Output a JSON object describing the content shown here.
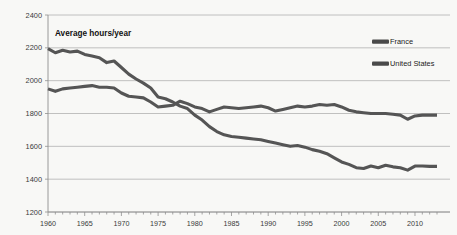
{
  "chart_data": {
    "type": "line",
    "title": "",
    "subtitle": "",
    "annotation": "Average hours/year",
    "xlabel": "",
    "ylabel": "Average hours/year",
    "xlim": [
      1960,
      2013
    ],
    "ylim": [
      1200,
      2400
    ],
    "yticks": [
      1200,
      1400,
      1600,
      1800,
      2000,
      2200,
      2400
    ],
    "ytick_labels": [
      "1200",
      "1400",
      "1600",
      "1800",
      "2000",
      "2200",
      "2400"
    ],
    "xticks": [
      1960,
      1965,
      1970,
      1975,
      1980,
      1985,
      1990,
      1995,
      2000,
      2005,
      2010
    ],
    "xtick_labels": [
      "1960",
      "1965",
      "1970",
      "1975",
      "1980",
      "1985",
      "1990",
      "1995",
      "2000",
      "2005",
      "2010"
    ],
    "x_minor_tick_step": 1,
    "grid": "horizontal",
    "legend_position": "top-right",
    "x": [
      1960,
      1961,
      1962,
      1963,
      1964,
      1965,
      1966,
      1967,
      1968,
      1969,
      1970,
      1971,
      1972,
      1973,
      1974,
      1975,
      1976,
      1977,
      1978,
      1979,
      1980,
      1981,
      1982,
      1983,
      1984,
      1985,
      1986,
      1987,
      1988,
      1989,
      1990,
      1991,
      1992,
      1993,
      1994,
      1995,
      1996,
      1997,
      1998,
      1999,
      2000,
      2001,
      2002,
      2003,
      2004,
      2005,
      2006,
      2007,
      2008,
      2009,
      2010,
      2011,
      2012,
      2013
    ],
    "series": [
      {
        "name": "France",
        "color": "#555555",
        "values": [
          2195,
          2170,
          2185,
          2175,
          2180,
          2160,
          2150,
          2140,
          2110,
          2120,
          2080,
          2040,
          2010,
          1985,
          1955,
          1900,
          1890,
          1870,
          1845,
          1830,
          1790,
          1760,
          1720,
          1690,
          1670,
          1660,
          1655,
          1650,
          1645,
          1640,
          1630,
          1620,
          1610,
          1600,
          1605,
          1595,
          1580,
          1570,
          1555,
          1530,
          1505,
          1490,
          1470,
          1465,
          1480,
          1470,
          1485,
          1475,
          1470,
          1455,
          1480,
          1480,
          1478,
          1478
        ]
      },
      {
        "name": "United States",
        "color": "#555555",
        "values": [
          1950,
          1935,
          1950,
          1955,
          1960,
          1965,
          1970,
          1960,
          1960,
          1955,
          1925,
          1905,
          1900,
          1895,
          1870,
          1840,
          1845,
          1850,
          1875,
          1860,
          1840,
          1830,
          1810,
          1825,
          1840,
          1835,
          1830,
          1835,
          1840,
          1845,
          1835,
          1815,
          1825,
          1835,
          1845,
          1840,
          1845,
          1855,
          1850,
          1855,
          1840,
          1820,
          1810,
          1805,
          1800,
          1800,
          1800,
          1795,
          1790,
          1765,
          1785,
          1790,
          1790,
          1790
        ]
      }
    ]
  },
  "legend": {
    "items": [
      {
        "label": "France",
        "swatch_color": "#4a4a4a"
      },
      {
        "label": "United States",
        "swatch_color": "#4a4a4a"
      }
    ]
  },
  "style": {
    "background": "#f8f8f6",
    "gridline_color": "#b9b9b9",
    "axis_color": "#8f8f8f",
    "text_color": "#3a3a3a"
  }
}
